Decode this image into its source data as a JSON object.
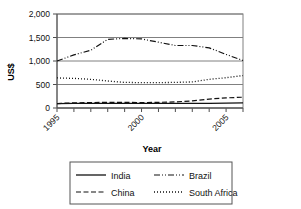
{
  "chart_data": {
    "type": "line",
    "title": "",
    "xlabel": "Year",
    "ylabel": "US$",
    "x": [
      1995,
      1996,
      1997,
      1998,
      1999,
      2000,
      2001,
      2002,
      2003,
      2004,
      2005,
      2006
    ],
    "xtick_labels": [
      "1995",
      "2000",
      "2005"
    ],
    "xtick_label_values": [
      1995,
      2000,
      2005
    ],
    "ytick_labels": [
      "0",
      "500",
      "1,000",
      "1,500",
      "2,000"
    ],
    "ytick_values": [
      0,
      500,
      1000,
      1500,
      2000
    ],
    "ylim": [
      0,
      2000
    ],
    "xlim": [
      1995,
      2006
    ],
    "grid": "horizontal",
    "legend_position": "bottom",
    "series": [
      {
        "name": "India",
        "style": "solid",
        "values": [
          95,
          100,
          100,
          100,
          100,
          100,
          100,
          100,
          100,
          100,
          105,
          110
        ]
      },
      {
        "name": "Brazil",
        "style": "dash-dot",
        "values": [
          1000,
          1130,
          1230,
          1460,
          1480,
          1470,
          1400,
          1330,
          1330,
          1280,
          1140,
          1010
        ]
      },
      {
        "name": "China",
        "style": "dashed",
        "values": [
          95,
          110,
          115,
          120,
          120,
          115,
          120,
          130,
          150,
          190,
          215,
          230
        ]
      },
      {
        "name": "South Africa",
        "style": "dotted",
        "values": [
          640,
          630,
          610,
          575,
          545,
          540,
          540,
          545,
          555,
          610,
          645,
          690
        ]
      }
    ]
  },
  "legend": {
    "entries": [
      {
        "label": "India",
        "style": "solid"
      },
      {
        "label": "Brazil",
        "style": "dash-dot"
      },
      {
        "label": "China",
        "style": "dashed"
      },
      {
        "label": "South Africa",
        "style": "dotted"
      }
    ]
  }
}
